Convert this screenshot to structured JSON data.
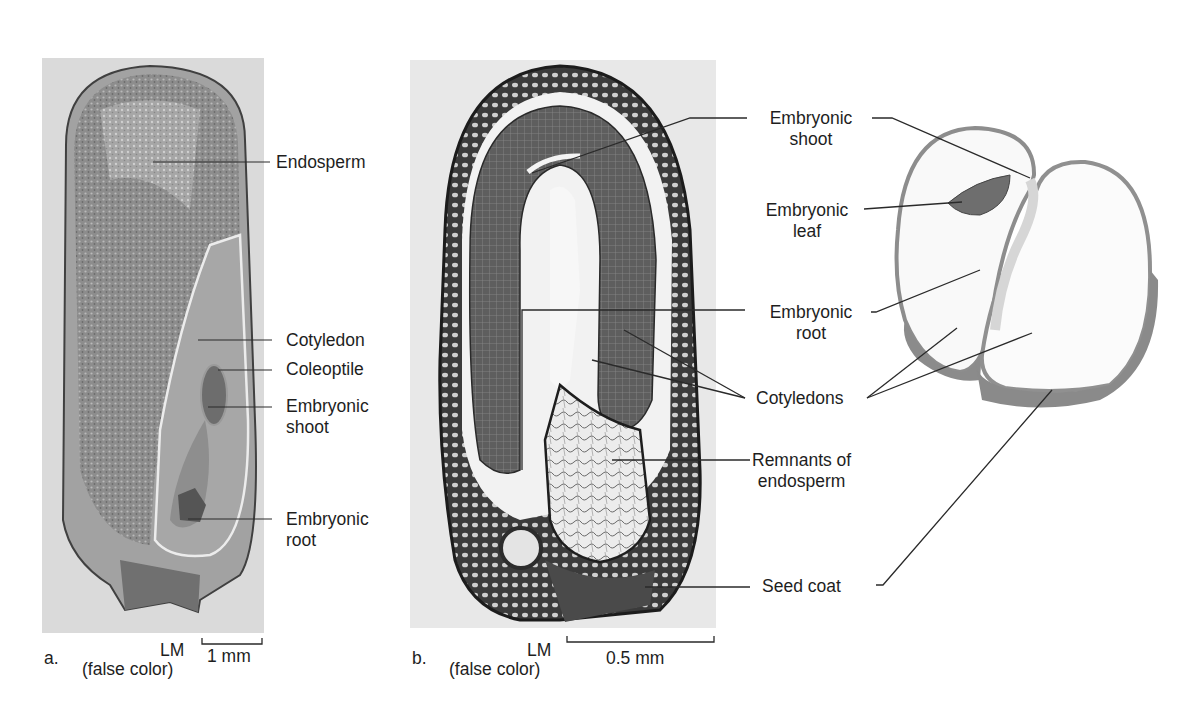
{
  "figure": {
    "panel_a": {
      "letter": "a.",
      "micrograph": "LM",
      "micrograph_note": "(false color)",
      "scale": "1 mm",
      "labels": {
        "endosperm": "Endosperm",
        "cotyledon": "Cotyledon",
        "coleoptile": "Coleoptile",
        "shoot_1": "Embryonic",
        "shoot_2": "shoot",
        "root_1": "Embryonic",
        "root_2": "root"
      }
    },
    "panel_b": {
      "letter": "b.",
      "micrograph": "LM",
      "micrograph_note": "(false color)",
      "scale": "0.5 mm",
      "labels": {
        "shoot_1": "Embryonic",
        "shoot_2": "shoot",
        "leaf_1": "Embryonic",
        "leaf_2": "leaf",
        "root_1": "Embryonic",
        "root_2": "root",
        "cotyledons": "Cotyledons",
        "remnants_1": "Remnants of",
        "remnants_2": "endosperm",
        "seed_coat": "Seed coat"
      }
    },
    "colors": {
      "photo_bg": "#d9d9d9",
      "tissue_dark": "#3a3a3a",
      "tissue_mid": "#7a7a7a",
      "leader": "#2a2a2a"
    }
  }
}
